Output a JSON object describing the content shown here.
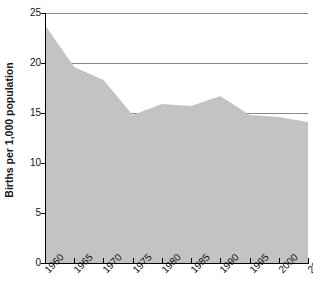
{
  "chart_data": {
    "type": "area",
    "title": "",
    "xlabel": "",
    "ylabel": "Births per 1,000 population",
    "x": [
      1960,
      1965,
      1970,
      1975,
      1980,
      1985,
      1990,
      1995,
      2000,
      2005
    ],
    "values": [
      23.8,
      19.6,
      18.3,
      14.8,
      15.9,
      15.7,
      16.7,
      14.8,
      14.6,
      14.1
    ],
    "categories": [
      "1960",
      "1965",
      "1970",
      "1975",
      "1980",
      "1985",
      "1990",
      "1995",
      "2000",
      "2005"
    ],
    "series": [
      {
        "name": "Births per 1,000 population",
        "values": [
          23.8,
          19.6,
          18.3,
          14.8,
          15.9,
          15.7,
          16.7,
          14.8,
          14.6,
          14.1
        ]
      }
    ],
    "xlim": [
      1960,
      2005
    ],
    "ylim": [
      0,
      25
    ],
    "y_ticks": [
      0,
      5,
      10,
      15,
      20,
      25
    ],
    "y_tick_labels": [
      "0",
      "5",
      "10",
      "15",
      "20",
      "25"
    ],
    "x_ticks": [
      1960,
      1965,
      1970,
      1975,
      1980,
      1985,
      1990,
      1995,
      2000,
      2005
    ],
    "x_tick_labels": [
      "1960",
      "1965",
      "1970",
      "1975",
      "1980",
      "1985",
      "1990",
      "1995",
      "2000",
      "2005"
    ],
    "grid": true,
    "grid_axis": "y",
    "legend": false,
    "legend_position": "none",
    "colors": {
      "area_fill": "#c3c3c3",
      "grid_line": "#888888",
      "axis_line": "#000000",
      "text": "#111111",
      "background": "#ffffff"
    }
  },
  "axes": {
    "y_title": "Births per 1,000 population"
  }
}
